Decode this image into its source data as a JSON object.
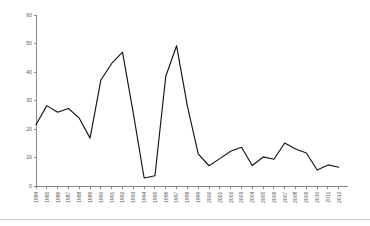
{
  "chart_data": {
    "type": "line",
    "title": "",
    "subtitle": "",
    "xlabel": "",
    "ylabel": "",
    "categories": [
      "1984",
      "1985",
      "1986",
      "1987",
      "1988",
      "1989",
      "1990",
      "1991",
      "1992",
      "1993",
      "1994",
      "1995",
      "1996",
      "1997",
      "1998",
      "1999",
      "2000",
      "2001",
      "2002",
      "2003",
      "2004",
      "2005",
      "2006",
      "2007",
      "2008",
      "2009",
      "2010",
      "2011",
      "2012"
    ],
    "values": [
      21.5,
      28.2,
      25.9,
      27.2,
      23.8,
      16.8,
      37.2,
      43.0,
      47.0,
      25.5,
      2.8,
      3.6,
      38.5,
      49.2,
      28.0,
      11.3,
      7.1,
      9.6,
      12.2,
      13.6,
      7.2,
      10.2,
      9.4,
      15.1,
      13.0,
      11.6,
      5.6,
      7.4,
      6.6
    ],
    "series": [
      {
        "name": "series-1",
        "color": "#141414",
        "values": [
          21.5,
          28.2,
          25.9,
          27.2,
          23.8,
          16.8,
          37.2,
          43.0,
          47.0,
          25.5,
          2.8,
          3.6,
          38.5,
          49.2,
          28.0,
          11.3,
          7.1,
          9.6,
          12.2,
          13.6,
          7.2,
          10.2,
          9.4,
          15.1,
          13.0,
          11.6,
          5.6,
          7.4,
          6.6
        ]
      }
    ],
    "yticks": [
      0,
      10,
      20,
      30,
      40,
      50,
      60
    ],
    "ytick_labels": [
      "0",
      "10",
      "20",
      "30",
      "40",
      "50",
      "60"
    ],
    "ylim": [
      0,
      60
    ],
    "xlim_index": [
      0,
      28
    ],
    "grid": false,
    "legend": false,
    "legend_position": "none",
    "x_label_rotation": -90,
    "axis_color": "#6b6b6b",
    "line_color": "#141414",
    "background_color": "#ffffff"
  }
}
